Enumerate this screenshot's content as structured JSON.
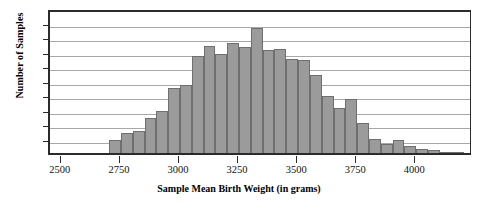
{
  "chart_data": {
    "type": "bar",
    "title": "",
    "xlabel": "Sample Mean Birth Weight (in grams)",
    "ylabel": "Number of Samples",
    "xlim": [
      2450,
      4240
    ],
    "ylim": [
      0,
      100
    ],
    "grid": true,
    "legend": null,
    "bin_width": 50,
    "bar_color": "#9b9b9b",
    "bar_edge_color": "#6f6f6f",
    "axis_color": "#2b2b2b",
    "gridline_color": "#a8a8a8",
    "yticks": [
      0,
      10,
      20,
      30,
      40,
      50,
      60,
      70,
      80,
      90,
      100
    ],
    "ytick_labels": [
      "0",
      "10",
      "20",
      "30",
      "40",
      "50",
      "60",
      "70",
      "80",
      "90",
      "100"
    ],
    "xticks": [
      2500,
      2750,
      3000,
      3250,
      3500,
      3750,
      4000
    ],
    "xtick_labels": [
      "2500",
      "2750",
      "3000",
      "3250",
      "3500",
      "3750",
      "4000"
    ],
    "bin_starts": [
      2700,
      2750,
      2800,
      2850,
      2900,
      2950,
      3000,
      3050,
      3100,
      3150,
      3200,
      3250,
      3300,
      3350,
      3400,
      3450,
      3500,
      3550,
      3600,
      3650,
      3700,
      3750,
      3800,
      3850,
      3900,
      3950,
      4000,
      4050,
      4100,
      4150
    ],
    "values": [
      9,
      14,
      15,
      24,
      29,
      45,
      47,
      67,
      74,
      68,
      76,
      73,
      86,
      71,
      72,
      65,
      64,
      54,
      39,
      31,
      37,
      21,
      10,
      6,
      9,
      5,
      3,
      2,
      1,
      1
    ]
  }
}
